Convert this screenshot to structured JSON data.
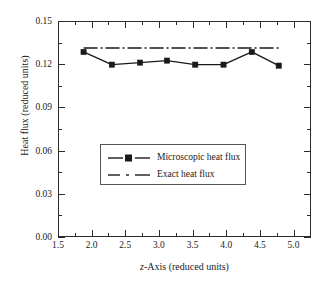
{
  "chart_data": {
    "type": "line",
    "title": "",
    "xlabel": "z-Axis (reduced units)",
    "ylabel": "Heat flux (reduced units)",
    "xlim": [
      1.5,
      5.26
    ],
    "ylim": [
      0.0,
      0.15
    ],
    "xticks": [
      1.5,
      2.0,
      2.5,
      3.0,
      3.5,
      4.0,
      4.5,
      5.0
    ],
    "xticklabels": [
      "1.5",
      "2.0",
      "2.5",
      "3.0",
      "3.5",
      "4.0",
      "4.5",
      "5.0"
    ],
    "yticks": [
      0.0,
      0.03,
      0.06,
      0.09,
      0.12,
      0.15
    ],
    "yticklabels": [
      "0.00",
      "0.03",
      "0.06",
      "0.09",
      "0.12",
      "0.15"
    ],
    "grid": false,
    "legend_position": "center-left",
    "series": [
      {
        "name": "Microscopic heat flux",
        "marker": "filled-square",
        "linestyle": "solid",
        "color": "#1a1a1a",
        "x": [
          1.88,
          2.3,
          2.72,
          3.12,
          3.54,
          3.96,
          4.38,
          4.78
        ],
        "y": [
          0.1285,
          0.1197,
          0.1211,
          0.1225,
          0.1197,
          0.1197,
          0.1285,
          0.119
        ]
      },
      {
        "name": "Exact heat flux",
        "marker": "none",
        "linestyle": "dash-dot",
        "color": "#1a1a1a",
        "x": [
          1.88,
          4.78
        ],
        "y": [
          0.1313,
          0.1313
        ]
      }
    ]
  },
  "axes": {
    "x_title_prefix": "z",
    "x_title_rest": "-Axis (reduced units)",
    "y_title": "Heat flux (reduced units)"
  },
  "legend": {
    "entries": [
      {
        "label": "Microscopic heat flux",
        "key": "line-square-marker"
      },
      {
        "label": "Exact heat flux",
        "key": "dash-dot-line"
      }
    ]
  }
}
